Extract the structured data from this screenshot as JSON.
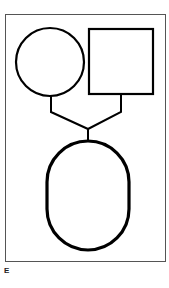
{
  "figure": {
    "panel_label": "E",
    "colors": {
      "stroke": "#000000",
      "frame": "#555555",
      "background": "#ffffff"
    },
    "shapes": [
      {
        "name": "circle",
        "cx": 50,
        "cy": 62,
        "r": 34
      },
      {
        "name": "square",
        "x": 89,
        "y": 29,
        "w": 64,
        "h": 65
      },
      {
        "name": "oval",
        "cx": 88,
        "cy": 196,
        "rx": 41,
        "ry": 55
      }
    ]
  }
}
